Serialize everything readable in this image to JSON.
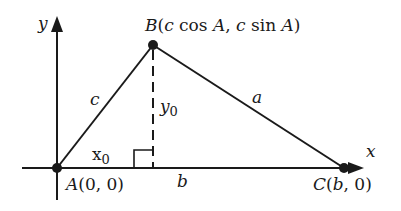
{
  "diagram": {
    "axes": {
      "x_label": "x",
      "y_label": "y"
    },
    "points": {
      "A": {
        "name": "A",
        "coords": "(0, 0)"
      },
      "B": {
        "name": "B",
        "coords_parts": [
          "(",
          "c",
          " cos ",
          "A",
          ", ",
          "c",
          " sin ",
          "A",
          ")"
        ]
      },
      "C": {
        "name": "C",
        "coords_parts": [
          "(",
          "b",
          ", 0)"
        ]
      }
    },
    "sides": {
      "a": "a",
      "b": "b",
      "c": "c"
    },
    "height": {
      "label": "y",
      "sub": "0"
    },
    "foot": {
      "label": "x",
      "sub": "0"
    },
    "colors": {
      "ink": "#1a1a1a",
      "background": "#ffffff"
    }
  }
}
